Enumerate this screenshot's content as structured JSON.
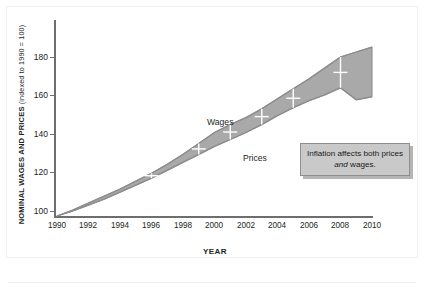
{
  "chart_data": {
    "type": "area",
    "title": "",
    "subtitle": "",
    "xlabel": "YEAR",
    "ylabel": "NOMINAL WAGES AND PRICES",
    "ylabel_note": "(indexed to 1990 = 100)",
    "xlim": [
      1990,
      2010
    ],
    "ylim": [
      100,
      190
    ],
    "yticks": [
      100,
      120,
      140,
      160,
      180
    ],
    "xticks": [
      1990,
      1992,
      1994,
      1996,
      1998,
      2000,
      2002,
      2004,
      2006,
      2008,
      2010
    ],
    "grid": false,
    "legend_position": "inline-annotations",
    "x": [
      1990,
      1991,
      1992,
      1993,
      1994,
      1995,
      1996,
      1997,
      1998,
      1999,
      2000,
      2001,
      2002,
      2003,
      2004,
      2005,
      2006,
      2007,
      2008,
      2009,
      2010
    ],
    "series": [
      {
        "name": "Wages",
        "values": [
          100,
          103,
          106.5,
          110,
          113.5,
          117.5,
          121.5,
          126,
          131,
          136.5,
          142,
          146,
          149.5,
          154,
          159,
          164,
          169,
          174.5,
          180,
          182.5,
          185
        ]
      },
      {
        "name": "Prices",
        "values": [
          100,
          102.5,
          105.5,
          108.5,
          112,
          115.5,
          119,
          123,
          127,
          131,
          135,
          138.5,
          142,
          146,
          150.5,
          154.5,
          158,
          161,
          164.5,
          158.5,
          160
        ]
      }
    ],
    "annotations": [
      {
        "name": "wages-label",
        "text": "Wages"
      },
      {
        "name": "prices-label",
        "text": "Prices"
      },
      {
        "name": "callout",
        "text_before": "Inflation affects both prices ",
        "text_emphasis": "and",
        "text_after": " wages."
      }
    ],
    "colors": {
      "band_fill": "#a9a9a9",
      "band_edge": "#8d8d8d",
      "axis": "#6e6e6e",
      "text": "#231f20",
      "callout_fill": "#c9c9c9",
      "callout_border": "#8e8e8e"
    }
  },
  "axes": {
    "y_title_main": "NOMINAL WAGES AND PRICES",
    "y_title_paren": " (indexed to 1990 = 100)",
    "x_title": "YEAR",
    "y_tick_labels": [
      "180",
      "160",
      "140",
      "120",
      "100"
    ],
    "x_tick_labels": [
      "1990",
      "1992",
      "1994",
      "1996",
      "1998",
      "2000",
      "2002",
      "2004",
      "2006",
      "2008",
      "2010"
    ]
  },
  "labels": {
    "wages": "Wages",
    "prices": "Prices"
  },
  "callout": {
    "before": "Inflation affects both prices ",
    "emphasis": "and",
    "after": " wages."
  }
}
